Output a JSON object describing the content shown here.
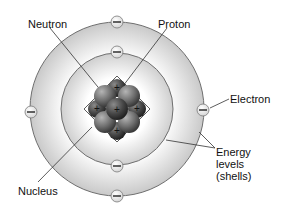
{
  "diagram": {
    "labels": {
      "neutron": "Neutron",
      "proton": "Proton",
      "electron": "Electron",
      "energy_levels_line1": "Energy",
      "energy_levels_line2": "levels",
      "energy_levels_line3": "(shells)",
      "nucleus": "Nucleus"
    },
    "electron_symbol": "−",
    "proton_symbol": "+",
    "shells": [
      {
        "name": "inner-shell",
        "electrons": 2
      },
      {
        "name": "outer-shell",
        "electrons": 4
      }
    ],
    "colors": {
      "shell_fill": "#dcdcdc",
      "shell_stroke": "#6f6f6f",
      "nucleon": "#777777",
      "line": "#333333"
    }
  }
}
